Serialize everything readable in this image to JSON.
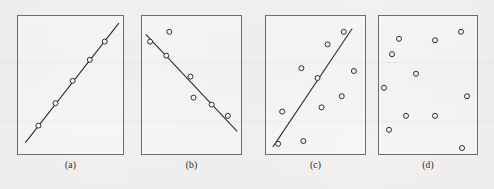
{
  "figure": {
    "width": 494,
    "height": 189,
    "background_color": "#f2f1ef",
    "frame_color": "#6e6e72",
    "ink_color": "#2f2f33",
    "marker_color": "#2f2f33",
    "marker_fill": "#f7f6f4",
    "caption_color": "#2a2a2c"
  },
  "chart_data": [
    {
      "type": "scatter",
      "title": "(a)",
      "caption": "(a)",
      "description": "perfect strong positive linear correlation",
      "xlabel": "",
      "ylabel": "",
      "xlim": [
        0,
        100
      ],
      "ylim": [
        0,
        100
      ],
      "grid": false,
      "legend": "none",
      "axis_ticks": false,
      "frame": {
        "x": 17,
        "y": 15,
        "width": 107,
        "height": 140
      },
      "points": [
        {
          "x": 20,
          "y": 21
        },
        {
          "x": 36,
          "y": 37
        },
        {
          "x": 52,
          "y": 53
        },
        {
          "x": 68,
          "y": 68
        },
        {
          "x": 82,
          "y": 81
        }
      ],
      "trend_line": {
        "x0": 8,
        "y0": 9,
        "x1": 95,
        "y1": 94,
        "present": true
      }
    },
    {
      "type": "scatter",
      "title": "(b)",
      "caption": "(b)",
      "description": "strong negative linear correlation",
      "xlabel": "",
      "ylabel": "",
      "xlim": [
        0,
        100
      ],
      "ylim": [
        0,
        100
      ],
      "grid": false,
      "legend": "none",
      "axis_ticks": false,
      "frame": {
        "x": 141,
        "y": 15,
        "width": 101,
        "height": 140
      },
      "points": [
        {
          "x": 9,
          "y": 81
        },
        {
          "x": 28,
          "y": 88
        },
        {
          "x": 25,
          "y": 71
        },
        {
          "x": 49,
          "y": 56
        },
        {
          "x": 52,
          "y": 41
        },
        {
          "x": 70,
          "y": 36
        },
        {
          "x": 86,
          "y": 28
        }
      ],
      "trend_line": {
        "x0": 5,
        "y0": 86,
        "x1": 95,
        "y1": 17,
        "present": true
      }
    },
    {
      "type": "scatter",
      "title": "(c)",
      "caption": "(c)",
      "description": "weak positive correlation with scatter",
      "xlabel": "",
      "ylabel": "",
      "xlim": [
        0,
        100
      ],
      "ylim": [
        0,
        100
      ],
      "grid": false,
      "legend": "none",
      "axis_ticks": false,
      "frame": {
        "x": 265,
        "y": 15,
        "width": 101,
        "height": 140
      },
      "points": [
        {
          "x": 78,
          "y": 88
        },
        {
          "x": 62,
          "y": 79
        },
        {
          "x": 36,
          "y": 62
        },
        {
          "x": 52,
          "y": 55
        },
        {
          "x": 88,
          "y": 60
        },
        {
          "x": 76,
          "y": 42
        },
        {
          "x": 56,
          "y": 34
        },
        {
          "x": 17,
          "y": 31
        },
        {
          "x": 38,
          "y": 10
        },
        {
          "x": 13,
          "y": 8
        }
      ],
      "trend_line": {
        "x0": 8,
        "y0": 6,
        "x1": 86,
        "y1": 90,
        "present": true
      }
    },
    {
      "type": "scatter",
      "title": "(d)",
      "caption": "(d)",
      "description": "no correlation, random scatter, no trend line",
      "xlabel": "",
      "ylabel": "",
      "xlim": [
        0,
        100
      ],
      "ylim": [
        0,
        100
      ],
      "grid": false,
      "legend": "none",
      "axis_ticks": false,
      "frame": {
        "x": 378,
        "y": 15,
        "width": 100,
        "height": 140
      },
      "points": [
        {
          "x": 83,
          "y": 88
        },
        {
          "x": 21,
          "y": 83
        },
        {
          "x": 57,
          "y": 82
        },
        {
          "x": 14,
          "y": 72
        },
        {
          "x": 38,
          "y": 58
        },
        {
          "x": 6,
          "y": 48
        },
        {
          "x": 89,
          "y": 42
        },
        {
          "x": 28,
          "y": 28
        },
        {
          "x": 57,
          "y": 28
        },
        {
          "x": 11,
          "y": 18
        },
        {
          "x": 84,
          "y": 5
        }
      ],
      "trend_line": {
        "present": false
      }
    }
  ]
}
